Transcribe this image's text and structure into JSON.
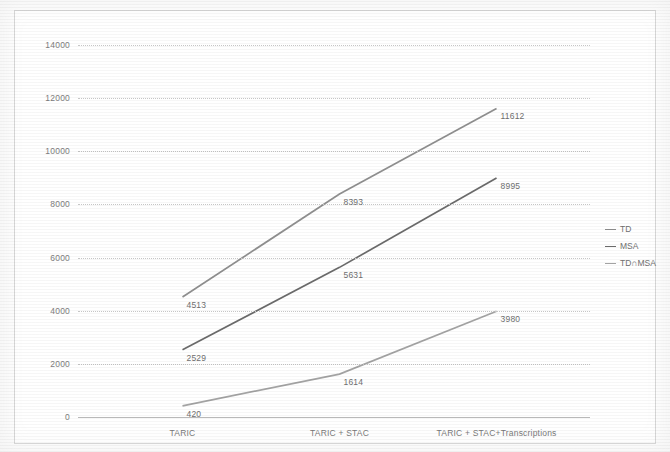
{
  "chart_data": {
    "type": "line",
    "title": "",
    "xlabel": "",
    "ylabel": "",
    "categories": [
      "TARIC",
      "TARIC + STAC",
      "TARIC + STAC+Transcriptions"
    ],
    "ylim": [
      0,
      14000
    ],
    "yticks": [
      "0",
      "2000",
      "4000",
      "6000",
      "8000",
      "10000",
      "12000",
      "14000"
    ],
    "ytick_values": [
      0,
      2000,
      4000,
      6000,
      8000,
      10000,
      12000,
      14000
    ],
    "grid": true,
    "legend_position": "right",
    "series": [
      {
        "name": "TD",
        "color": "#8f8f8f",
        "values": [
          4513,
          8393,
          11612
        ],
        "labels": [
          "4513",
          "8393",
          "11612"
        ]
      },
      {
        "name": "MSA",
        "color": "#6b6b6b",
        "values": [
          2529,
          5631,
          8995
        ],
        "labels": [
          "2529",
          "5631",
          "8995"
        ]
      },
      {
        "name": "TD∩MSA",
        "color": "#a3a3a3",
        "values": [
          420,
          1614,
          3980
        ],
        "labels": [
          "420",
          "1614",
          "3980"
        ]
      }
    ]
  },
  "legend": {
    "items": [
      {
        "label": "TD",
        "color": "#8f8f8f"
      },
      {
        "label": "MSA",
        "color": "#6b6b6b"
      },
      {
        "label": "TD∩MSA",
        "color": "#a3a3a3"
      }
    ]
  },
  "colors": {
    "grid": "#c6c6c6",
    "text": "#737373",
    "frame": "#d8d8d8",
    "background": "#ffffff"
  }
}
